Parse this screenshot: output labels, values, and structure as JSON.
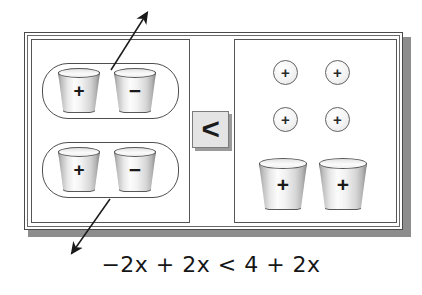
{
  "diagram": {
    "equation": "−2x + 2x < 4 + 2x",
    "equation_parts": {
      "left_side": "−2x + 2x",
      "operator": "<",
      "right_side": "4 + 2x"
    },
    "comparator": {
      "symbol": "<",
      "name": "less-than"
    },
    "left_panel": {
      "groups": [
        {
          "name": "zero-pair-group-top",
          "cups": [
            {
              "sign": "+",
              "label": "plus-cup"
            },
            {
              "sign": "−",
              "label": "minus-cup"
            }
          ]
        },
        {
          "name": "zero-pair-group-bottom",
          "cups": [
            {
              "sign": "+",
              "label": "plus-cup"
            },
            {
              "sign": "−",
              "label": "minus-cup"
            }
          ]
        }
      ]
    },
    "right_panel": {
      "chips": [
        {
          "sign": "+"
        },
        {
          "sign": "+"
        },
        {
          "sign": "+"
        },
        {
          "sign": "+"
        }
      ],
      "cups": [
        {
          "sign": "+"
        },
        {
          "sign": "+"
        }
      ]
    },
    "annotations": [
      {
        "name": "arrow-upper-left",
        "direction": "up-right"
      },
      {
        "name": "arrow-lower-left",
        "direction": "down-left"
      }
    ],
    "colors": {
      "frame_stroke": "#4a4a4a",
      "frame_shadow": "#8d8d8d",
      "cup_outline": "#585858",
      "comparator_fill": "#e4e4e4",
      "text": "#161616"
    }
  }
}
